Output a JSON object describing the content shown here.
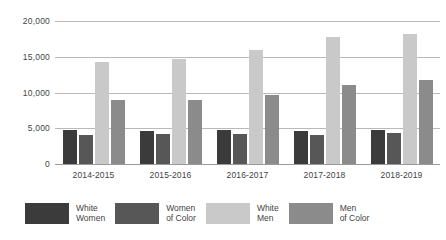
{
  "chart_data": {
    "type": "bar",
    "title": "",
    "subtitle": "",
    "xlabel": "",
    "ylabel": "",
    "categories": [
      "2014-2015",
      "2015-2016",
      "2016-2017",
      "2017-2018",
      "2018-2019"
    ],
    "series": [
      {
        "name": "White Women",
        "legend_label_line1": "White",
        "legend_label_line2": "Women",
        "color": "#3b3b3b",
        "values": [
          4800,
          4600,
          4750,
          4650,
          4800
        ]
      },
      {
        "name": "Women of Color",
        "legend_label_line1": "Women",
        "legend_label_line2": "of Color",
        "color": "#575757",
        "values": [
          4000,
          4200,
          4250,
          4050,
          4400
        ]
      },
      {
        "name": "White Men",
        "legend_label_line1": "White",
        "legend_label_line2": "Men",
        "color": "#c9c9c9",
        "values": [
          14200,
          14700,
          15900,
          17800,
          18200
        ]
      },
      {
        "name": "Men of Color",
        "legend_label_line1": "Men",
        "legend_label_line2": "of Color",
        "color": "#8b8b8b",
        "values": [
          9000,
          8900,
          9600,
          11100,
          11800
        ]
      }
    ],
    "ylim": [
      0,
      20000
    ],
    "yticks": [
      0,
      5000,
      10000,
      15000,
      20000
    ],
    "ytick_labels": [
      "0",
      "5,000",
      "10,000",
      "15,000",
      "20,000"
    ],
    "grid": true,
    "grid_color": "#b9b9b9",
    "legend_position": "bottom",
    "background": "#ffffff"
  }
}
